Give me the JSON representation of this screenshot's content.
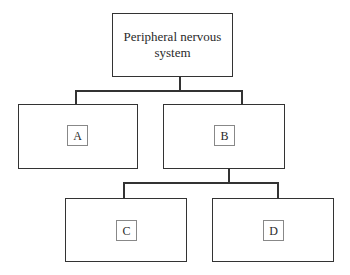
{
  "diagram": {
    "type": "hierarchy-tree",
    "root": {
      "id": "root",
      "label": "Peripheral nervous system",
      "line1": "Peripheral nervous",
      "line2": "system"
    },
    "level1": [
      {
        "id": "A",
        "label": "A",
        "parent": "root"
      },
      {
        "id": "B",
        "label": "B",
        "parent": "root"
      }
    ],
    "level2": [
      {
        "id": "C",
        "label": "C",
        "parent": "B"
      },
      {
        "id": "D",
        "label": "D",
        "parent": "B"
      }
    ],
    "colors": {
      "stroke": "#333333",
      "label_border": "#888888",
      "background": "#ffffff"
    }
  }
}
